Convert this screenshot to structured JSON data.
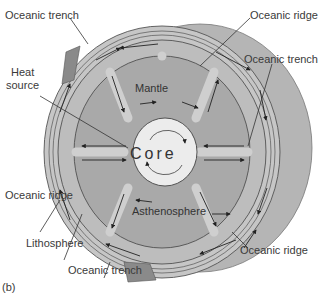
{
  "diagram": {
    "panel_label": "(b)",
    "core_label": "Core",
    "mantle_label": "Mantle",
    "asthenosphere_label": "Asthenosphere",
    "callouts": {
      "trench_top_left": "Oceanic trench",
      "ridge_top_right": "Oceanic ridge",
      "trench_right": "Oceanic trench",
      "heat_source_line1": "Heat",
      "heat_source_line2": "source",
      "ridge_left": "Oceanic ridge",
      "lithosphere": "Lithosphere",
      "trench_bottom": "Oceanic trench",
      "ridge_bottom_right": "Oceanic ridge"
    },
    "colors": {
      "outer_sphere": "#b5b5b5",
      "lithosphere": "#c4c4c4",
      "mantle": "#a9a9a9",
      "asthenosphere_band": "#bdbdbd",
      "core": "#ececec",
      "plate_dark": "#8a8a8a",
      "line": "#333333"
    }
  }
}
